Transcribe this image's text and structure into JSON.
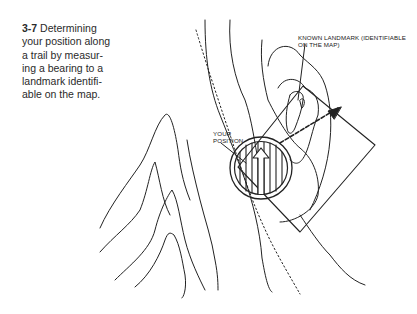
{
  "figure": {
    "number": "3-7",
    "caption": "Determining your position along a trail by measuring a bearing to a landmark identifiable on the map.",
    "caption_lines": [
      "Determining",
      "your position along",
      "a trail by measur-",
      "ing a bearing to a",
      "landmark identifi-",
      "able on the map."
    ]
  },
  "labels": {
    "landmark_line1": "KNOWN LANDMARK (IDENTIFIABLE",
    "landmark_line2": "ON THE MAP)",
    "position_line1": "YOUR",
    "position_line2": "POSITION"
  },
  "colors": {
    "ink": "#222222",
    "background": "#ffffff"
  }
}
